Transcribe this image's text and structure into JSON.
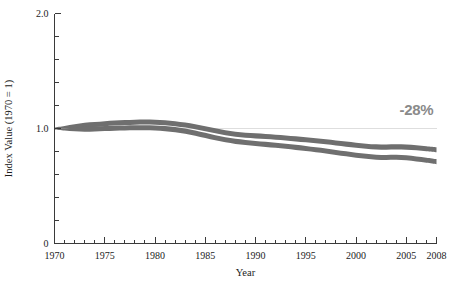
{
  "chart_data": {
    "type": "area",
    "title": "",
    "subtitle": "",
    "xlabel": "Year",
    "ylabel": "Index Value (1970 = 1)",
    "xlim": [
      1970,
      2008
    ],
    "ylim": [
      0,
      2.0
    ],
    "grid": "single horizontal reference gridline at y = 1.0",
    "legend_position": "none",
    "y_ticks_major": [
      "0",
      "1.0",
      "2.0"
    ],
    "y_tick_values_major": [
      0,
      1.0,
      2.0
    ],
    "y_tick_values_minor": [
      0.2,
      0.4,
      0.6,
      0.8,
      1.2,
      1.4,
      1.6,
      1.8
    ],
    "x_ticks_major": [
      "1970",
      "1975",
      "1980",
      "1985",
      "1990",
      "1995",
      "2000",
      "2005",
      "2008"
    ],
    "x_tick_values_major": [
      1970,
      1975,
      1980,
      1985,
      1990,
      1995,
      2000,
      2005,
      2008
    ],
    "x_tick_minor_step": 1,
    "annotations": [
      {
        "text": "-28%",
        "x": 2006,
        "y": 1.12,
        "color": "#8a8a8a"
      }
    ],
    "x": [
      1970,
      1971,
      1972,
      1973,
      1974,
      1975,
      1976,
      1977,
      1978,
      1979,
      1980,
      1981,
      1982,
      1983,
      1984,
      1985,
      1986,
      1987,
      1988,
      1989,
      1990,
      1991,
      1992,
      1993,
      1994,
      1995,
      1996,
      1997,
      1998,
      1999,
      2000,
      2001,
      2002,
      2003,
      2004,
      2005,
      2006,
      2007,
      2008
    ],
    "series": [
      {
        "name": "Upper bound",
        "color": "#6f6f6f",
        "values": [
          1.005,
          1.012,
          1.02,
          1.028,
          1.035,
          1.042,
          1.048,
          1.052,
          1.055,
          1.056,
          1.055,
          1.05,
          1.042,
          1.03,
          1.015,
          0.998,
          0.98,
          0.963,
          0.95,
          0.942,
          0.936,
          0.93,
          0.924,
          0.918,
          0.91,
          0.902,
          0.893,
          0.884,
          0.874,
          0.864,
          0.854,
          0.846,
          0.84,
          0.838,
          0.84,
          0.838,
          0.832,
          0.824,
          0.815
        ]
      },
      {
        "name": "Lower bound",
        "color": "#6f6f6f",
        "values": [
          0.995,
          0.992,
          0.992,
          0.994,
          0.997,
          1.0,
          1.003,
          1.005,
          1.006,
          1.006,
          1.004,
          0.999,
          0.99,
          0.977,
          0.96,
          0.94,
          0.92,
          0.902,
          0.888,
          0.878,
          0.87,
          0.862,
          0.854,
          0.846,
          0.836,
          0.826,
          0.815,
          0.804,
          0.792,
          0.78,
          0.768,
          0.758,
          0.75,
          0.748,
          0.75,
          0.745,
          0.735,
          0.724,
          0.712
        ]
      }
    ],
    "band_half_thickness": 0.022,
    "net_change_percent": -28
  },
  "axis": {
    "y_label": "Index Value (1970 = 1)",
    "x_label": "Year"
  },
  "annotation": {
    "change_label": "-28%"
  },
  "colors": {
    "band": "#6f6f6f",
    "axis": "#3a3a3a",
    "gridline": "#dedede",
    "annotation": "#8a8a8a",
    "background": "#ffffff"
  }
}
